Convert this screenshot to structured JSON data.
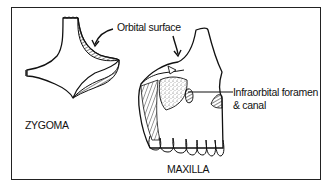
{
  "figure": {
    "bones": [
      {
        "id": "zygoma",
        "label": "ZYGOMA"
      },
      {
        "id": "maxilla",
        "label": "MAXILLA"
      }
    ],
    "annotations": [
      {
        "id": "orbital-surface",
        "label": "Orbital surface"
      },
      {
        "id": "infraorbital-foramen",
        "label_line1": "Infraorbital foramen",
        "label_line2": "& canal"
      }
    ],
    "colors": {
      "ink": "#111111",
      "background": "#ffffff"
    }
  }
}
